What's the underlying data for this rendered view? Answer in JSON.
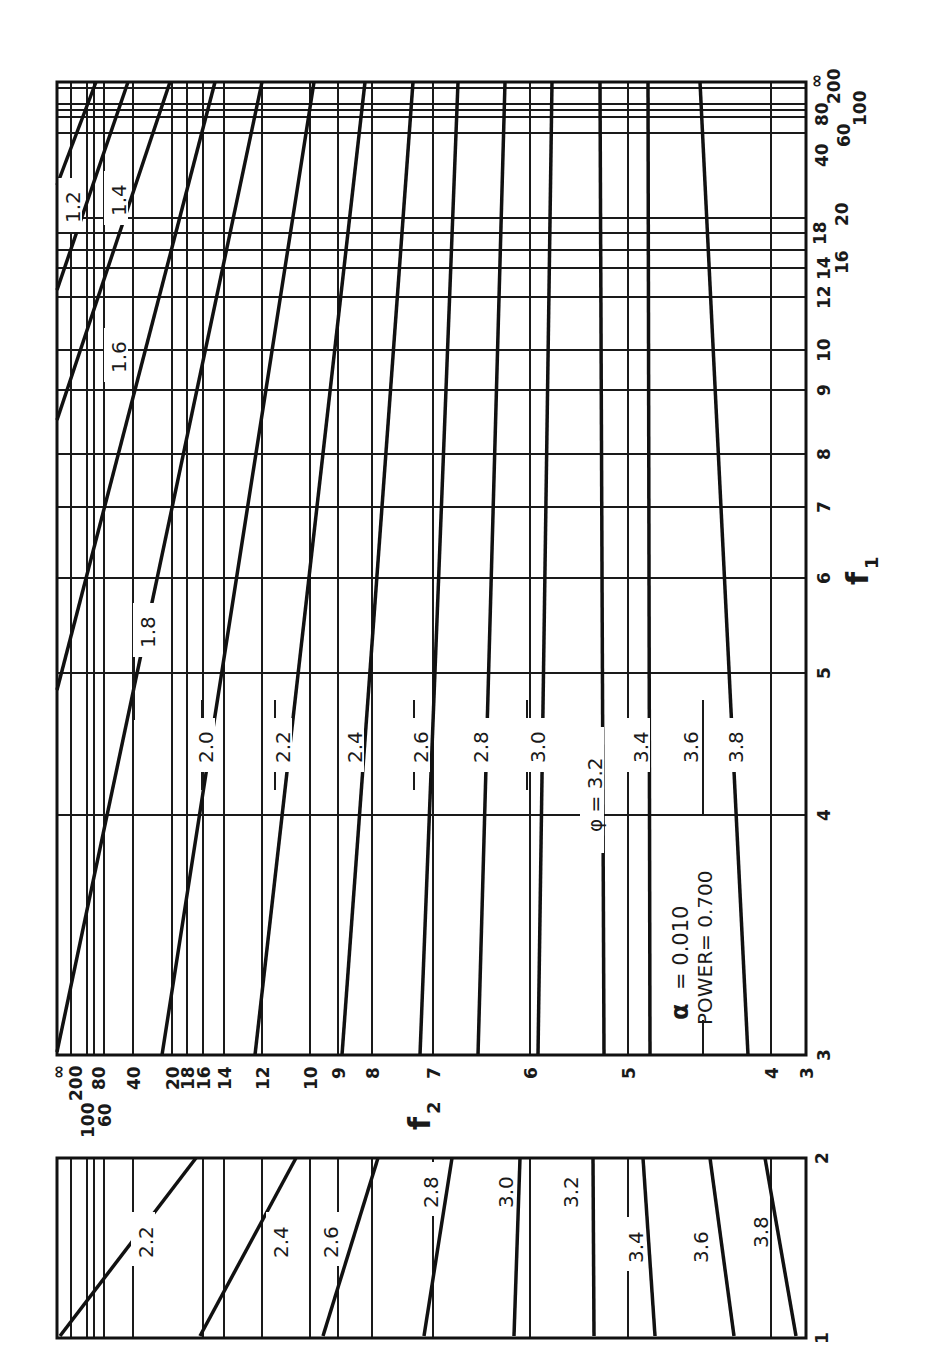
{
  "chart_data": [
    {
      "type": "line",
      "title": "Power chart (alpha = 0.010, power = 0.700)",
      "orientation": "rotated 90 degrees clockwise",
      "xlabel": "f1",
      "ylabel": "f2",
      "annotation": {
        "alpha_label": "α",
        "alpha_text": "= 0.010",
        "power_text": "POWER= 0.700",
        "phi_label": "φ = 3.2"
      },
      "f1_ticks": [
        "3",
        "4",
        "5",
        "6",
        "7",
        "8",
        "9",
        "10",
        "12",
        "14",
        "16",
        "18",
        "20",
        "40",
        "60",
        "80",
        "100",
        "200",
        "∞"
      ],
      "f2_ticks": [
        "∞",
        "200",
        "100",
        "80",
        "60",
        "40",
        "20",
        "18",
        "16",
        "14",
        "12",
        "10",
        "9",
        "8",
        "7",
        "6",
        "5",
        "4",
        "3"
      ],
      "series": [
        {
          "name": "φ = 1.2",
          "label": "1.2"
        },
        {
          "name": "φ = 1.4",
          "label": "1.4"
        },
        {
          "name": "φ = 1.6",
          "label": "1.6"
        },
        {
          "name": "φ = 1.8",
          "label": "1.8"
        },
        {
          "name": "φ = 2.0",
          "label": "2.0"
        },
        {
          "name": "φ = 2.2",
          "label": "2.2"
        },
        {
          "name": "φ = 2.4",
          "label": "2.4"
        },
        {
          "name": "φ = 2.6",
          "label": "2.6"
        },
        {
          "name": "φ = 2.8",
          "label": "2.8"
        },
        {
          "name": "φ = 3.0",
          "label": "3.0"
        },
        {
          "name": "φ = 3.2",
          "label": "φ = 3.2"
        },
        {
          "name": "φ = 3.4",
          "label": "3.4"
        },
        {
          "name": "φ = 3.6",
          "label": "3.6"
        },
        {
          "name": "φ = 3.8",
          "label": "3.8"
        }
      ],
      "grid": true,
      "xlim": [
        3,
        "∞"
      ],
      "ylim": [
        3,
        "∞"
      ]
    },
    {
      "type": "line",
      "title": "Inset for f1 from 1 to 2",
      "xlabel": "f1",
      "f1_ticks": [
        "1",
        "2"
      ],
      "series_labels": [
        "2.2",
        "2.4",
        "2.6",
        "2.8",
        "3.0",
        "3.2",
        "3.4",
        "3.6",
        "3.8"
      ],
      "grid": true,
      "xlim": [
        1,
        2
      ]
    }
  ],
  "main": {
    "frame": {
      "x0": 57,
      "y0": 82,
      "x1": 806,
      "y1": 1055
    },
    "f1_grid": [
      {
        "label": "∞",
        "y": 82,
        "show": true
      },
      {
        "label": "200",
        "y": 88,
        "show": true
      },
      {
        "label": "100",
        "y": 104,
        "show": true
      },
      {
        "label": "80",
        "y": 110,
        "show": true
      },
      {
        "label": "60",
        "y": 117,
        "show": true
      },
      {
        "label": "40",
        "y": 133,
        "show": true
      },
      {
        "label": "20",
        "y": 218,
        "show": true
      },
      {
        "label": "18",
        "y": 233,
        "show": true
      },
      {
        "label": "16",
        "y": 250,
        "show": true
      },
      {
        "label": "14",
        "y": 268,
        "show": true
      },
      {
        "label": "12",
        "y": 297,
        "show": true
      },
      {
        "label": "10",
        "y": 350,
        "show": true
      },
      {
        "label": "9",
        "y": 390,
        "show": true
      },
      {
        "label": "8",
        "y": 454,
        "show": true
      },
      {
        "label": "7",
        "y": 507,
        "show": true
      },
      {
        "label": "6",
        "y": 578,
        "show": true
      },
      {
        "label": "5",
        "y": 673,
        "show": true
      },
      {
        "label": "4",
        "y": 815,
        "show": true
      },
      {
        "label": "3",
        "y": 1055,
        "show": true
      }
    ],
    "f2_grid": [
      {
        "label": "∞",
        "x": 57
      },
      {
        "label": "200",
        "x": 71
      },
      {
        "label": "100",
        "x": 87
      },
      {
        "label": "80",
        "x": 94
      },
      {
        "label": "60",
        "x": 104
      },
      {
        "label": "40",
        "x": 133
      },
      {
        "label": "20",
        "x": 172
      },
      {
        "label": "18",
        "x": 187
      },
      {
        "label": "16",
        "x": 203
      },
      {
        "label": "14",
        "x": 224
      },
      {
        "label": "12",
        "x": 262
      },
      {
        "label": "10",
        "x": 310
      },
      {
        "label": "9",
        "x": 338
      },
      {
        "label": "8",
        "x": 372
      },
      {
        "label": "7",
        "x": 433
      },
      {
        "label": "6",
        "x": 530
      },
      {
        "label": "5",
        "x": 628
      },
      {
        "label": "4",
        "x": 771
      },
      {
        "label": "3",
        "x": 806
      }
    ],
    "curves": [
      {
        "label": "1.2",
        "pts": [
          [
            57,
            185
          ],
          [
            96,
            82
          ]
        ],
        "lx": 72,
        "ly": 205
      },
      {
        "label": "1.4",
        "pts": [
          [
            57,
            290
          ],
          [
            128,
            82
          ]
        ],
        "lx": 118,
        "ly": 198
      },
      {
        "label": "1.6",
        "pts": [
          [
            57,
            420
          ],
          [
            170,
            82
          ]
        ],
        "lx": 118,
        "ly": 355
      },
      {
        "label": "1.8",
        "pts": [
          [
            57,
            690
          ],
          [
            215,
            82
          ]
        ],
        "lx": 147,
        "ly": 630
      },
      {
        "label": "2.0",
        "pts": [
          [
            57,
            1052
          ],
          [
            262,
            82
          ]
        ],
        "lx": 205,
        "ly": 745
      },
      {
        "label": "2.2",
        "pts": [
          [
            162,
            1055
          ],
          [
            314,
            82
          ]
        ],
        "lx": 282,
        "ly": 745
      },
      {
        "label": "2.4",
        "pts": [
          [
            255,
            1055
          ],
          [
            365,
            82
          ]
        ],
        "lx": 354,
        "ly": 745
      },
      {
        "label": "2.6",
        "pts": [
          [
            342,
            1055
          ],
          [
            413,
            82
          ]
        ],
        "lx": 420,
        "ly": 745
      },
      {
        "label": "2.8",
        "pts": [
          [
            420,
            1055
          ],
          [
            458,
            82
          ]
        ],
        "lx": 480,
        "ly": 745
      },
      {
        "label": "3.0",
        "pts": [
          [
            478,
            1055
          ],
          [
            505,
            82
          ]
        ],
        "lx": 537,
        "ly": 745
      },
      {
        "label": "φ = 3.2",
        "pts": [
          [
            538,
            1055
          ],
          [
            552,
            82
          ]
        ],
        "lx": 594,
        "ly": 790
      },
      {
        "label": "3.4",
        "pts": [
          [
            604,
            1055
          ],
          [
            600,
            82
          ]
        ],
        "lx": 640,
        "ly": 745
      },
      {
        "label": "3.6",
        "pts": [
          [
            650,
            1055
          ],
          [
            648,
            82
          ]
        ],
        "lx": 690,
        "ly": 745
      },
      {
        "label": "3.8",
        "pts": [
          [
            748,
            1055
          ],
          [
            700,
            82
          ]
        ],
        "lx": 735,
        "ly": 745
      }
    ],
    "label_ticks": [
      {
        "x": 134,
        "y0": 630,
        "y1": 720
      },
      {
        "x": 202,
        "y0": 700,
        "y1": 730
      },
      {
        "x": 202,
        "y0": 765,
        "y1": 790
      },
      {
        "x": 275,
        "y0": 700,
        "y1": 730
      },
      {
        "x": 275,
        "y0": 765,
        "y1": 790
      },
      {
        "x": 414,
        "y0": 700,
        "y1": 730
      },
      {
        "x": 414,
        "y0": 765,
        "y1": 790
      },
      {
        "x": 527,
        "y0": 700,
        "y1": 730
      },
      {
        "x": 527,
        "y0": 765,
        "y1": 790
      },
      {
        "x": 703,
        "y0": 700,
        "y1": 815
      },
      {
        "x": 703,
        "y0": 1020,
        "y1": 1055
      }
    ]
  },
  "inset": {
    "frame": {
      "x0": 57,
      "y0": 1158,
      "x1": 806,
      "y1": 1338
    },
    "grid_x": [
      71,
      87,
      94,
      104,
      133,
      203,
      224,
      262,
      310,
      338,
      372,
      433,
      530,
      628,
      771
    ],
    "curves": [
      {
        "label": "2.2",
        "pts": [
          [
            60,
            1336
          ],
          [
            196,
            1158
          ]
        ],
        "lx": 145,
        "ly": 1240
      },
      {
        "label": "2.4",
        "pts": [
          [
            200,
            1336
          ],
          [
            296,
            1158
          ]
        ],
        "lx": 280,
        "ly": 1240
      },
      {
        "label": "2.6",
        "pts": [
          [
            323,
            1336
          ],
          [
            378,
            1158
          ]
        ],
        "lx": 330,
        "ly": 1240
      },
      {
        "label": "2.8",
        "pts": [
          [
            424,
            1336
          ],
          [
            452,
            1158
          ]
        ],
        "lx": 430,
        "ly": 1190
      },
      {
        "label": "3.0",
        "pts": [
          [
            514,
            1336
          ],
          [
            520,
            1158
          ]
        ],
        "lx": 505,
        "ly": 1190
      },
      {
        "label": "3.2",
        "pts": [
          [
            594,
            1336
          ],
          [
            593,
            1158
          ]
        ],
        "lx": 570,
        "ly": 1190
      },
      {
        "label": "3.4",
        "pts": [
          [
            655,
            1336
          ],
          [
            643,
            1158
          ]
        ],
        "lx": 635,
        "ly": 1245
      },
      {
        "label": "3.6",
        "pts": [
          [
            734,
            1336
          ],
          [
            710,
            1158
          ]
        ],
        "lx": 700,
        "ly": 1245
      },
      {
        "label": "3.8",
        "pts": [
          [
            796,
            1336
          ],
          [
            765,
            1158
          ]
        ],
        "lx": 760,
        "ly": 1230
      }
    ],
    "f1_ticks": [
      {
        "label": "2",
        "y": 1158
      },
      {
        "label": "1",
        "y": 1338
      }
    ]
  },
  "axis_labels": {
    "f1": "f",
    "f1_sub": "1",
    "f2": "f",
    "f2_sub": "2"
  }
}
